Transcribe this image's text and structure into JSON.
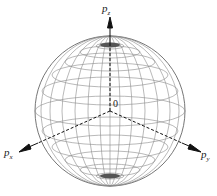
{
  "diagram": {
    "title": "",
    "type": "wireframe-sphere-momentum-space",
    "axes": [
      {
        "name": "pz",
        "base": "p",
        "sub": "z"
      },
      {
        "name": "px",
        "base": "p",
        "sub": "x"
      },
      {
        "name": "py",
        "base": "p",
        "sub": "y"
      }
    ],
    "origin_label": "0",
    "colors": {
      "wire": "#8a8a8a",
      "axis": "#111111"
    }
  }
}
